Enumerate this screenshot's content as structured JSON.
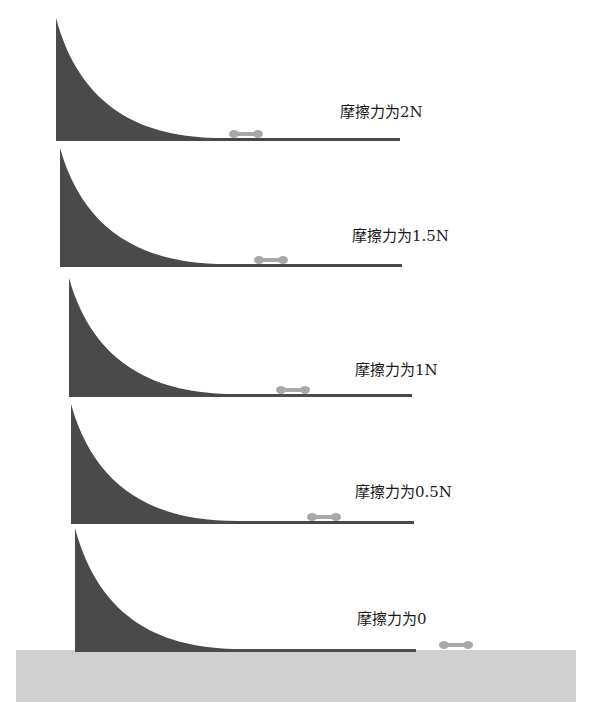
{
  "figure": {
    "colors": {
      "ramp": "#4a4a4a",
      "ground": "#d0d0d0",
      "car": "#a8a8a8",
      "background": "#ffffff"
    }
  },
  "ramps": [
    {
      "label": "摩擦力为2N",
      "top_y": 18,
      "base_y": 141,
      "left_x": 56,
      "right_x": 400,
      "car_x": 230,
      "label_x": 340,
      "label_y": 110
    },
    {
      "label": "摩擦力为1.5N",
      "top_y": 148,
      "base_y": 267,
      "left_x": 60,
      "right_x": 402,
      "car_x": 255,
      "label_x": 352,
      "label_y": 234
    },
    {
      "label": "摩擦力为1N",
      "top_y": 278,
      "base_y": 397,
      "left_x": 69,
      "right_x": 412,
      "car_x": 277,
      "label_x": 355,
      "label_y": 368
    },
    {
      "label": "摩擦力为0.5N",
      "top_y": 404,
      "base_y": 524,
      "left_x": 71,
      "right_x": 414,
      "car_x": 308,
      "label_x": 355,
      "label_y": 490
    },
    {
      "label": "摩擦力为0",
      "top_y": 528,
      "base_y": 652,
      "left_x": 75,
      "right_x": 416,
      "car_x": 440,
      "label_x": 357,
      "label_y": 617
    }
  ],
  "ground": {
    "x": 16,
    "y": 650,
    "width": 560,
    "height": 52
  }
}
